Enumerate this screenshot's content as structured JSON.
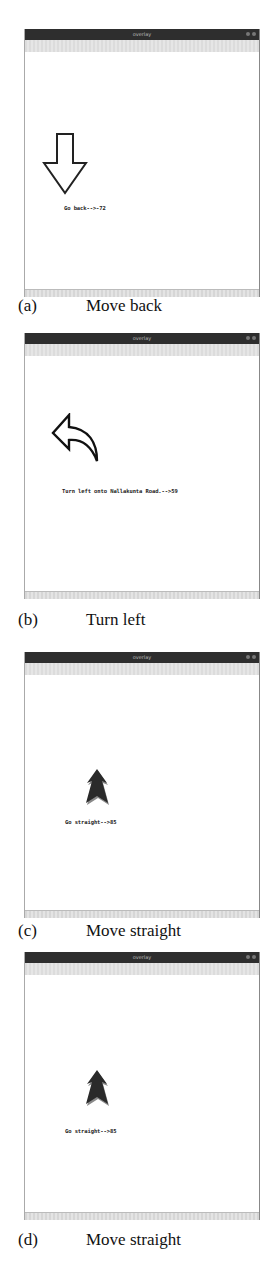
{
  "figure": {
    "panels": [
      {
        "id": "a",
        "window_title": "overlay",
        "message": "Go back-->-72",
        "icon": "arrow-down-outline-icon",
        "caption_label": "(a)",
        "caption_text": "Move back"
      },
      {
        "id": "b",
        "window_title": "overlay",
        "message": "Turn left onto Nallakunta Road.-->59",
        "icon": "arrow-turn-left-icon",
        "caption_label": "(b)",
        "caption_text": "Turn left"
      },
      {
        "id": "c",
        "window_title": "overlay",
        "message": "Go straight-->85",
        "icon": "arrow-up-filled-icon",
        "caption_label": "(c)",
        "caption_text": "Move straight"
      },
      {
        "id": "d",
        "window_title": "overlay",
        "message": "Go straight-->85",
        "icon": "arrow-up-filled-icon",
        "caption_label": "(d)",
        "caption_text": "Move straight"
      }
    ]
  }
}
